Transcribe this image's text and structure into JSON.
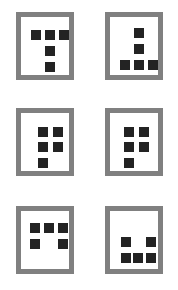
{
  "figure": {
    "name": "six-framed-square-patterns",
    "width": 178,
    "height": 290,
    "background_color": "#ffffff",
    "frame_color": "#808080",
    "frame_inner_color": "#ffffff",
    "dot_color": "#232323",
    "frame_border_width": 5,
    "dot_size": 10,
    "columns": 2,
    "rows": 3,
    "cells": [
      {
        "id": "cell-1",
        "position": "top-left",
        "index": 1,
        "x": 16,
        "y": 12,
        "width": 58,
        "height": 68,
        "dot_count": 5,
        "pattern_name": "t-shape-down",
        "pattern_description": "three squares across the top row, one square below the center, one square below that",
        "dots": [
          {
            "x": 10,
            "y": 13
          },
          {
            "x": 24,
            "y": 13
          },
          {
            "x": 38,
            "y": 13
          },
          {
            "x": 24,
            "y": 29
          },
          {
            "x": 24,
            "y": 45
          }
        ]
      },
      {
        "id": "cell-2",
        "position": "top-right",
        "index": 2,
        "x": 105,
        "y": 12,
        "width": 58,
        "height": 68,
        "dot_count": 5,
        "pattern_name": "t-shape-up",
        "pattern_description": "one square at the top, one square below it, three squares across the bottom row",
        "dots": [
          {
            "x": 24,
            "y": 11
          },
          {
            "x": 24,
            "y": 27
          },
          {
            "x": 10,
            "y": 43
          },
          {
            "x": 24,
            "y": 43
          },
          {
            "x": 38,
            "y": 43
          }
        ]
      },
      {
        "id": "cell-3",
        "position": "middle-left",
        "index": 3,
        "x": 16,
        "y": 108,
        "width": 58,
        "height": 68,
        "dot_count": 5,
        "pattern_name": "quad-plus-tail-left",
        "pattern_description": "two-by-two block of squares with one additional square below the left column",
        "dots": [
          {
            "x": 17,
            "y": 14
          },
          {
            "x": 32,
            "y": 14
          },
          {
            "x": 17,
            "y": 29
          },
          {
            "x": 32,
            "y": 29
          },
          {
            "x": 17,
            "y": 45
          }
        ]
      },
      {
        "id": "cell-4",
        "position": "middle-right",
        "index": 4,
        "x": 105,
        "y": 108,
        "width": 58,
        "height": 68,
        "dot_count": 5,
        "pattern_name": "quad-plus-tail-left",
        "pattern_description": "two-by-two block of squares with one additional square below the left column",
        "dots": [
          {
            "x": 14,
            "y": 14
          },
          {
            "x": 29,
            "y": 14
          },
          {
            "x": 14,
            "y": 29
          },
          {
            "x": 29,
            "y": 29
          },
          {
            "x": 14,
            "y": 45
          }
        ]
      },
      {
        "id": "cell-5",
        "position": "bottom-left",
        "index": 5,
        "x": 16,
        "y": 206,
        "width": 58,
        "height": 68,
        "dot_count": 5,
        "pattern_name": "three-over-two-outer",
        "pattern_description": "three squares across the top row, two squares below at the left and right positions leaving a gap in the middle",
        "dots": [
          {
            "x": 9,
            "y": 12
          },
          {
            "x": 23,
            "y": 12
          },
          {
            "x": 37,
            "y": 12
          },
          {
            "x": 9,
            "y": 28
          },
          {
            "x": 37,
            "y": 28
          }
        ]
      },
      {
        "id": "cell-6",
        "position": "bottom-right",
        "index": 6,
        "x": 105,
        "y": 206,
        "width": 58,
        "height": 68,
        "dot_count": 5,
        "pattern_name": "two-outer-over-three",
        "pattern_description": "two squares at the top at the left and right positions leaving a gap in the middle, three squares across the bottom row",
        "dots": [
          {
            "x": 11,
            "y": 26
          },
          {
            "x": 36,
            "y": 26
          },
          {
            "x": 11,
            "y": 42
          },
          {
            "x": 23,
            "y": 42
          },
          {
            "x": 36,
            "y": 42
          }
        ]
      }
    ]
  }
}
